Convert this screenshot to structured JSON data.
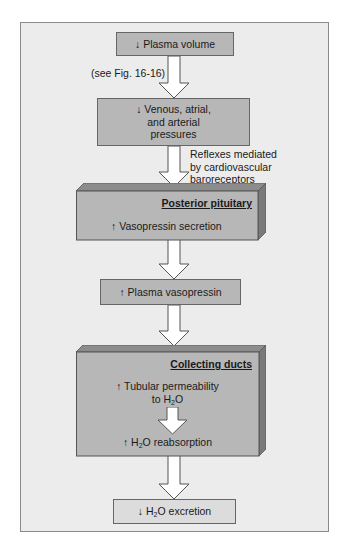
{
  "diagram": {
    "nodes": [
      {
        "id": "plasma-volume",
        "arrow": "↓",
        "label": "Plasma volume"
      },
      {
        "id": "pressures",
        "arrow": "↓",
        "label": "Venous, atrial, and arterial pressures",
        "lines": [
          "Venous, atrial,",
          "and arterial",
          "pressures"
        ]
      },
      {
        "id": "posterior-pituitary",
        "title": "Posterior pituitary",
        "arrow": "↑",
        "label": "Vasopressin secretion"
      },
      {
        "id": "plasma-vasopressin",
        "arrow": "↑",
        "label": "Plasma vasopressin"
      },
      {
        "id": "collecting-ducts",
        "title": "Collecting ducts",
        "items": [
          {
            "arrow": "↑",
            "line1": "Tubular permeability",
            "line2_pre": "to H",
            "line2_sub": "2",
            "line2_post": "O"
          },
          {
            "arrow": "↑",
            "pre": "H",
            "sub": "2",
            "post": "O reabsorption"
          }
        ]
      },
      {
        "id": "h2o-excretion",
        "arrow": "↓",
        "pre": "H",
        "sub": "2",
        "post": "O excretion"
      }
    ],
    "annotations": {
      "see_fig": "(see Fig. 16-16)",
      "reflex_lines": [
        "Reflexes mediated",
        "by cardiovascular",
        "baroreceptors"
      ]
    },
    "colors": {
      "panel": "#ececec",
      "box": "#b7b7b7",
      "box_top": "#8c8c8c",
      "box_side": "#7a7a7a",
      "border": "#666666"
    }
  }
}
